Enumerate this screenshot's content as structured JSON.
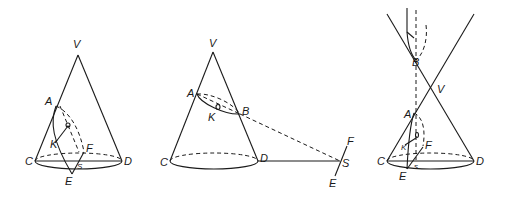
{
  "diagram": {
    "stroke_color": "#1a1a1a",
    "background": "#ffffff",
    "figures": [
      {
        "id": "fig1",
        "labels": {
          "V": "V",
          "A": "A",
          "O": "O",
          "K": "K",
          "F": "F",
          "C": "C",
          "D": "D",
          "S": "S",
          "E": "E"
        }
      },
      {
        "id": "fig2",
        "labels": {
          "V": "V",
          "A": "A",
          "B": "B",
          "K": "K",
          "O": "0",
          "C": "C",
          "D": "D",
          "S": "S",
          "F": "F",
          "E": "E"
        }
      },
      {
        "id": "fig3",
        "labels": {
          "B": "B",
          "V": "V",
          "A": "A",
          "O": "0",
          "K": "K",
          "F": "F",
          "C": "C",
          "D": "D",
          "S": "s",
          "E": "E"
        }
      }
    ]
  }
}
